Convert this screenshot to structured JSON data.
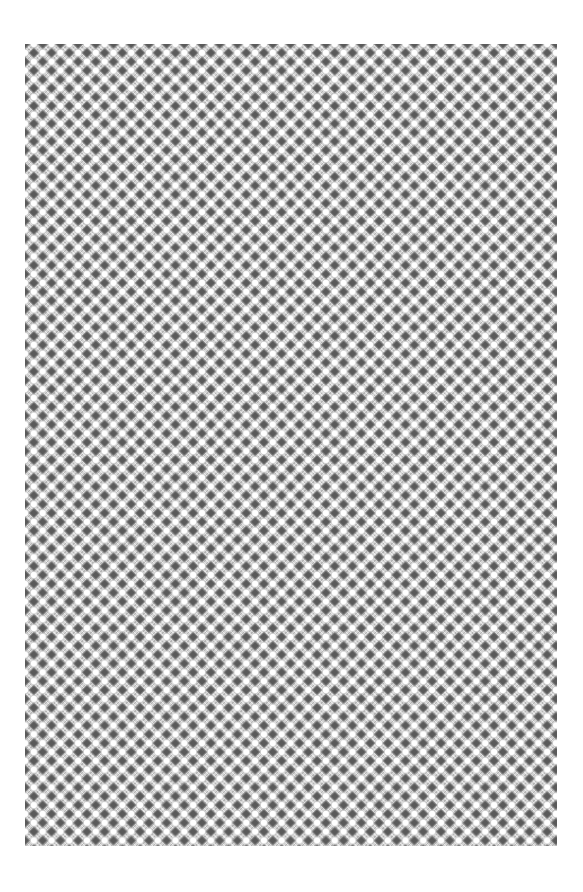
{
  "page": {
    "background_color": "#ffffff"
  },
  "pattern": {
    "region": {
      "x": 25,
      "y": 44,
      "width": 532,
      "height": 802
    },
    "tile_size": 17.7,
    "columns": 30,
    "rows": 45,
    "colors": {
      "base": "#d4d4d4",
      "hatch_light": "#f2f2f2",
      "hatch_dark": "#9a9a9a",
      "diamond": "#5a5a5a",
      "diamond_edge": "#888888",
      "circle": "#ffffff",
      "circle_edge": "#c8c8c8"
    },
    "motifs": [
      {
        "name": "dark-diamond",
        "offset": [
          0,
          0
        ],
        "size": 8
      },
      {
        "name": "white-circle",
        "offset": [
          0.5,
          0
        ],
        "radius": 3.6
      },
      {
        "name": "white-circle",
        "offset": [
          0,
          0.5
        ],
        "radius": 3.6
      },
      {
        "name": "dark-diamond",
        "offset": [
          0.5,
          0.5
        ],
        "size": 8
      }
    ]
  }
}
